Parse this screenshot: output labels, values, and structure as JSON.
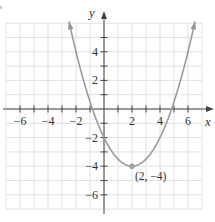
{
  "chart_data": {
    "type": "line",
    "title": "",
    "function": "f(x) = 0.5(x - 2)^2 - 4",
    "xlabel": "x",
    "ylabel": "y",
    "xlim": [
      -7,
      7
    ],
    "ylim": [
      -7,
      6
    ],
    "grid": true,
    "x_ticks": [
      -6,
      -5,
      -4,
      -3,
      -2,
      -1,
      1,
      2,
      3,
      4,
      5,
      6
    ],
    "x_tick_labels": [
      "−6",
      "−4",
      "−2",
      "2",
      "4",
      "6"
    ],
    "x_tick_label_values": [
      -6,
      -4,
      -2,
      2,
      4,
      6
    ],
    "y_ticks": [
      -6,
      -5,
      -4,
      -3,
      -2,
      -1,
      1,
      2,
      3,
      4,
      5
    ],
    "y_tick_labels": [
      "4",
      "2",
      "−2",
      "−4",
      "−6"
    ],
    "y_tick_label_values": [
      4,
      2,
      -2,
      -4,
      -6
    ],
    "series": [
      {
        "name": "parabola",
        "x_range": [
          -2.5,
          6.5
        ],
        "vertex": [
          2,
          -4
        ],
        "y_intercept": [
          0,
          -2
        ],
        "x_intercepts": [
          -0.83,
          4.83
        ],
        "color": "#9a9a9a",
        "arrows_at_ends": true
      }
    ],
    "annotations": [
      {
        "point": [
          2,
          -4
        ],
        "text": "(2, −4)",
        "marker_color": "#a0a0a0"
      }
    ],
    "legend": null
  },
  "colors": {
    "grid": "#d9d9d9",
    "axis": "#444444",
    "curve": "#9a9a9a",
    "text": "#333333"
  }
}
